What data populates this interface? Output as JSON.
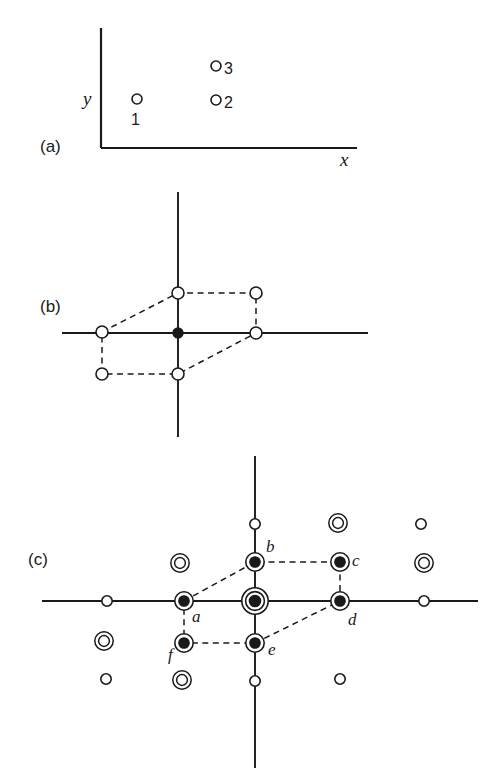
{
  "figure": {
    "width": 501,
    "height": 783,
    "background": "#ffffff",
    "ink": "#1a1a1a",
    "style": "scanned halftone line drawing, black ink on off-white paper"
  },
  "panels": [
    {
      "id": "a",
      "label": "(a)",
      "label_pos": [
        40,
        152
      ],
      "description": "quarter-plane axes with three open circle reflections labelled 1, 2, 3",
      "axes": {
        "type": "quadrant",
        "origin": [
          101,
          148
        ],
        "x_axis": {
          "from": [
            101,
            148
          ],
          "to": [
            357,
            148
          ],
          "label": "x",
          "label_pos": [
            340,
            166
          ]
        },
        "y_axis": {
          "from": [
            101,
            28
          ],
          "to": [
            101,
            148
          ],
          "label": "y",
          "label_pos": [
            83,
            105
          ]
        }
      },
      "points": [
        {
          "name": "1",
          "marker": "open-circle",
          "cx": 137,
          "cy": 99,
          "r": 5,
          "label": "1",
          "label_pos": [
            131,
            125
          ]
        },
        {
          "name": "2",
          "marker": "open-circle",
          "cx": 216,
          "cy": 100,
          "r": 5,
          "label": "2",
          "label_pos": [
            224,
            108
          ]
        },
        {
          "name": "3",
          "marker": "open-circle",
          "cx": 216,
          "cy": 66,
          "r": 5,
          "label": "3",
          "label_pos": [
            224,
            74
          ]
        }
      ]
    },
    {
      "id": "b",
      "label": "(b)",
      "label_pos": [
        40,
        312
      ],
      "description": "cross axes with a dashed hexagonal circuit of six open circles and one filled dot at the origin",
      "axes": {
        "type": "cross",
        "origin": [
          178,
          333
        ],
        "x_axis": {
          "from": [
            62,
            333
          ],
          "to": [
            368,
            333
          ]
        },
        "y_axis": {
          "from": [
            178,
            192
          ],
          "to": [
            178,
            437
          ]
        }
      },
      "points": [
        {
          "name": "origin",
          "marker": "filled-dot",
          "cx": 178,
          "cy": 333,
          "r": 5
        },
        {
          "name": "v1",
          "marker": "open-circle",
          "cx": 102,
          "cy": 332,
          "r": 6
        },
        {
          "name": "v2",
          "marker": "open-circle",
          "cx": 102,
          "cy": 374,
          "r": 6
        },
        {
          "name": "v3",
          "marker": "open-circle",
          "cx": 178,
          "cy": 374,
          "r": 6
        },
        {
          "name": "v4",
          "marker": "open-circle",
          "cx": 256,
          "cy": 333,
          "r": 6
        },
        {
          "name": "v5",
          "marker": "open-circle",
          "cx": 256,
          "cy": 293,
          "r": 6
        },
        {
          "name": "v6",
          "marker": "open-circle",
          "cx": 178,
          "cy": 293,
          "r": 6
        }
      ],
      "dashed_path": [
        [
          102,
          332
        ],
        [
          178,
          293
        ],
        [
          256,
          293
        ],
        [
          256,
          333
        ],
        [
          178,
          374
        ],
        [
          102,
          374
        ],
        [
          102,
          332
        ]
      ]
    },
    {
      "id": "c",
      "label": "(c)",
      "label_pos": [
        28,
        565
      ],
      "description": "cross axes over a lattice of three marker species: plain open circles, double-ring circles, and ringed filled dots; six labelled points a-f form a dashed hexagon about a triple-ring origin",
      "axes": {
        "type": "cross",
        "origin": [
          255,
          601
        ],
        "x_axis": {
          "from": [
            42,
            601
          ],
          "to": [
            478,
            601
          ]
        },
        "y_axis": {
          "from": [
            255,
            456
          ],
          "to": [
            255,
            768
          ]
        }
      },
      "labelled_points": [
        {
          "name": "a",
          "marker": "ringed-dot",
          "cx": 184,
          "cy": 601,
          "label": "a",
          "label_pos": [
            192,
            622
          ]
        },
        {
          "name": "b",
          "marker": "ringed-dot",
          "cx": 255,
          "cy": 562,
          "label": "b",
          "label_pos": [
            266,
            552
          ]
        },
        {
          "name": "c",
          "marker": "ringed-dot",
          "cx": 340,
          "cy": 562,
          "label": "c",
          "label_pos": [
            352,
            566
          ]
        },
        {
          "name": "d",
          "marker": "ringed-dot",
          "cx": 340,
          "cy": 601,
          "label": "d",
          "label_pos": [
            348,
            625
          ]
        },
        {
          "name": "e",
          "marker": "ringed-dot",
          "cx": 255,
          "cy": 643,
          "label": "e",
          "label_pos": [
            268,
            655
          ]
        },
        {
          "name": "f",
          "marker": "ringed-dot",
          "cx": 184,
          "cy": 643,
          "label": "f",
          "label_pos": [
            168,
            660
          ]
        },
        {
          "name": "origin",
          "marker": "triple-ring-dot",
          "cx": 255,
          "cy": 601
        }
      ],
      "dashed_path": [
        [
          184,
          601
        ],
        [
          255,
          562
        ],
        [
          340,
          562
        ],
        [
          340,
          601
        ],
        [
          255,
          643
        ],
        [
          184,
          643
        ],
        [
          184,
          601
        ]
      ],
      "lattice_points": [
        {
          "marker": "plain-circle",
          "cx": 107,
          "cy": 601
        },
        {
          "marker": "plain-circle",
          "cx": 424,
          "cy": 601
        },
        {
          "marker": "plain-circle",
          "cx": 255,
          "cy": 524
        },
        {
          "marker": "plain-circle",
          "cx": 255,
          "cy": 681
        },
        {
          "marker": "plain-circle",
          "cx": 106,
          "cy": 679
        },
        {
          "marker": "plain-circle",
          "cx": 340,
          "cy": 679
        },
        {
          "marker": "plain-circle",
          "cx": 421,
          "cy": 524
        },
        {
          "marker": "double-ring",
          "cx": 180,
          "cy": 563
        },
        {
          "marker": "double-ring",
          "cx": 338,
          "cy": 523
        },
        {
          "marker": "double-ring",
          "cx": 424,
          "cy": 563
        },
        {
          "marker": "double-ring",
          "cx": 104,
          "cy": 641
        },
        {
          "marker": "double-ring",
          "cx": 182,
          "cy": 680
        }
      ]
    }
  ],
  "markers": {
    "open-circle": "thin open circle, white fill",
    "filled-dot": "solid black disc",
    "plain-circle": "small thin open circle",
    "double-ring": "two concentric thin rings, white centre",
    "ringed-dot": "solid black disc inside a single ring",
    "triple-ring-dot": "solid black disc inside three concentric rings"
  }
}
